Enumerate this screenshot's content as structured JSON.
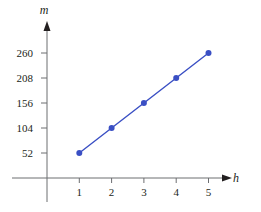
{
  "chart_data": {
    "type": "line",
    "title": "",
    "xlabel": "h",
    "ylabel": "m",
    "x": [
      1,
      2,
      3,
      4,
      5
    ],
    "series": [
      {
        "name": "m",
        "values": [
          52,
          104,
          156,
          208,
          260
        ],
        "color": "#3a4fc4",
        "markers": true
      }
    ],
    "x_ticks": [
      1,
      2,
      3,
      4,
      5
    ],
    "y_ticks": [
      52,
      104,
      156,
      208,
      260
    ],
    "xlim": [
      -1,
      6
    ],
    "ylim": [
      -52,
      300
    ],
    "grid": false,
    "legend": null
  },
  "axes": {
    "x_label": "h",
    "y_label": "m",
    "x_tick_labels": [
      "1",
      "2",
      "3",
      "4",
      "5"
    ],
    "y_tick_labels": [
      "52",
      "104",
      "156",
      "208",
      "260"
    ]
  },
  "colors": {
    "line": "#3a4fc4",
    "axis": "#6d6e71",
    "text": "#231f20"
  }
}
